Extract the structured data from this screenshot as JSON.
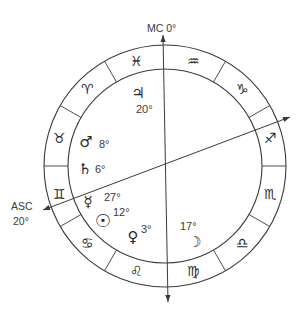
{
  "chart": {
    "type": "astrological-natal-chart",
    "center": {
      "x": 165,
      "y": 166
    },
    "outer_radius": 121,
    "inner_radius": 97,
    "stroke_color": "#3a3a3a",
    "text_color": "#2a2a2a",
    "background": "#ffffff"
  },
  "axes": {
    "mc": {
      "label": "MC 0°",
      "top": {
        "x": 163,
        "y": 35
      },
      "bottom": {
        "x": 168,
        "y": 302
      }
    },
    "asc": {
      "label_name": "ASC",
      "label_degree": "20°",
      "left": {
        "x": 43,
        "y": 210
      },
      "right": {
        "x": 290,
        "y": 117
      }
    }
  },
  "zodiac_signs": [
    {
      "name": "Pisces",
      "glyph": "♓",
      "angle": -15
    },
    {
      "name": "Aquarius",
      "glyph": "♒",
      "angle": 15
    },
    {
      "name": "Capricorn",
      "glyph": "♑",
      "angle": 45
    },
    {
      "name": "Sagittarius",
      "glyph": "♐",
      "angle": 75
    },
    {
      "name": "Scorpio",
      "glyph": "♏",
      "angle": 105
    },
    {
      "name": "Libra",
      "glyph": "♎",
      "angle": 135
    },
    {
      "name": "Virgo",
      "glyph": "♍",
      "angle": 165
    },
    {
      "name": "Leo",
      "glyph": "♌",
      "angle": 195
    },
    {
      "name": "Cancer",
      "glyph": "♋",
      "angle": 225
    },
    {
      "name": "Gemini",
      "glyph": "♊",
      "angle": 255
    },
    {
      "name": "Taurus",
      "glyph": "♉",
      "angle": 285
    },
    {
      "name": "Aries",
      "glyph": "♈",
      "angle": 315
    }
  ],
  "divider_angles": [
    30,
    60,
    90,
    120,
    150,
    210,
    240,
    270,
    300,
    330
  ],
  "planets": [
    {
      "name": "Jupiter",
      "glyph": "♃",
      "degree": "20°",
      "x": 138,
      "y": 93,
      "deg_x": 136,
      "deg_y": 109
    },
    {
      "name": "Mars",
      "glyph": "♂",
      "degree": "8°",
      "x": 86,
      "y": 142,
      "deg_x": 99,
      "deg_y": 144
    },
    {
      "name": "Saturn",
      "glyph": "♄",
      "degree": "6°",
      "x": 85,
      "y": 169,
      "deg_x": 95,
      "deg_y": 169
    },
    {
      "name": "Mercury",
      "glyph": "☿",
      "degree": "27°",
      "x": 88,
      "y": 202,
      "deg_x": 104,
      "deg_y": 197
    },
    {
      "name": "Sun",
      "glyph": "☉",
      "degree": "12°",
      "x": 103,
      "y": 220,
      "deg_x": 113,
      "deg_y": 212,
      "big": true
    },
    {
      "name": "Venus",
      "glyph": "♀",
      "degree": "3°",
      "x": 133,
      "y": 237,
      "deg_x": 141,
      "deg_y": 229
    },
    {
      "name": "Moon",
      "glyph": "☽",
      "degree": "17°",
      "x": 195,
      "y": 242,
      "deg_x": 180,
      "deg_y": 226
    }
  ]
}
